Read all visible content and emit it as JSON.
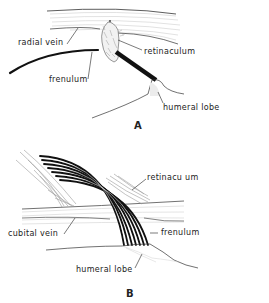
{
  "figure": {
    "panels": [
      {
        "id": "A",
        "letter": "A",
        "labels": {
          "radial_vein": "radial vein",
          "retinaculum": "retinaculum",
          "frenulum": "frenulum",
          "humeral_lobe": "humeral lobe"
        }
      },
      {
        "id": "B",
        "letter": "B",
        "labels": {
          "retinaculum": "retinacu um",
          "cubital_vein": "cubital vein",
          "frenulum": "frenulum",
          "humeral_lobe": "humeral lobe"
        }
      }
    ],
    "colors": {
      "ink": "#1a1a1a",
      "stipple": "#b8b8b8",
      "background": "#ffffff"
    }
  }
}
